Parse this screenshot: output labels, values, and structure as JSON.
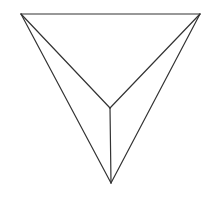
{
  "diagram": {
    "type": "tetrahedron-projection",
    "width": 211,
    "height": 197,
    "stroke_color": "#333333",
    "stroke_width": 1.2,
    "background": "#ffffff",
    "vertices": {
      "A": {
        "x": 21,
        "y": 14,
        "label": ""
      },
      "B": {
        "x": 200,
        "y": 14,
        "label": ""
      },
      "C": {
        "x": 111,
        "y": 183,
        "label": ""
      },
      "D": {
        "x": 110,
        "y": 108,
        "label": ""
      }
    },
    "edges": [
      {
        "from": "A",
        "to": "B"
      },
      {
        "from": "A",
        "to": "C"
      },
      {
        "from": "B",
        "to": "C"
      },
      {
        "from": "A",
        "to": "D"
      },
      {
        "from": "B",
        "to": "D"
      },
      {
        "from": "D",
        "to": "C"
      }
    ]
  }
}
